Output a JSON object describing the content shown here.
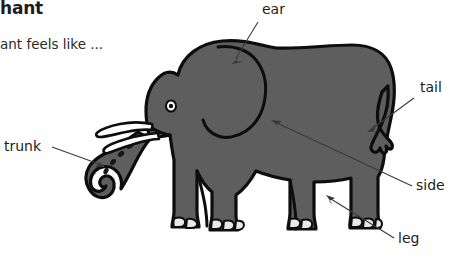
{
  "worksheet": {
    "title": "hant",
    "subtitle": "ant feels like ...",
    "background_color": "#ffffff",
    "text_color": "#1d1d1d"
  },
  "illustration": {
    "subject": "elephant",
    "body_color": "#5e5e5e",
    "outline_color": "#0d0d0d",
    "tusk_color": "#ffffff",
    "nail_color": "#e8e8e8",
    "leader_color": "#3a3a3a"
  },
  "callouts": [
    {
      "id": "ear",
      "label": "ear",
      "label_x": 262,
      "label_y": 14,
      "anchor_x": 232,
      "anchor_y": 62
    },
    {
      "id": "tail",
      "label": "tail",
      "label_x": 420,
      "label_y": 92,
      "anchor_x": 368,
      "anchor_y": 131
    },
    {
      "id": "side",
      "label": "side",
      "label_x": 416,
      "label_y": 190,
      "anchor_x": 272,
      "anchor_y": 126
    },
    {
      "id": "leg",
      "label": "leg",
      "label_x": 398,
      "label_y": 243,
      "anchor_x": 327,
      "anchor_y": 196
    },
    {
      "id": "trunk",
      "label": "trunk",
      "label_x": 4,
      "label_y": 151,
      "anchor_x": 104,
      "anchor_y": 167
    }
  ]
}
